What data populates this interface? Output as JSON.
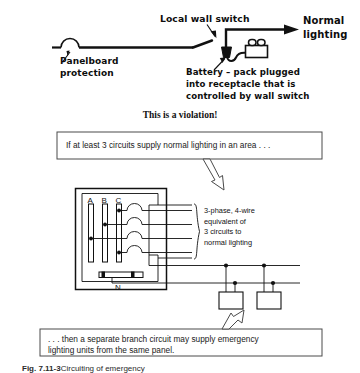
{
  "figure": {
    "type": "electrical-wiring-diagram",
    "caption_number": "Fig. 7.11-3",
    "caption_text": "Circuiting of emergency",
    "ink_color": "#111111",
    "background_color": "#ffffff"
  },
  "top_diagram": {
    "name": "violation-diagram",
    "labels": {
      "local_wall_switch": "Local wall switch",
      "normal_lighting": "Normal\nlighting",
      "panelboard_protection": "Panelboard\nprotection",
      "battery_pack": "Battery – pack plugged\ninto receptacle that is\ncontrolled by wall switch"
    },
    "verdict": "This is a violation!"
  },
  "callout_top": {
    "name": "condition-callout",
    "text": "If at least 3 circuits supply normal lighting in an area . . ."
  },
  "panel_diagram": {
    "name": "panelboard-diagram",
    "bus_labels": [
      "A",
      "B",
      "C"
    ],
    "neutral_label": "N",
    "annotation": "3-phase, 4-wire\nequivalent of\n3 circuits to\nnormal lighting",
    "breaker_count": 4,
    "emergency_unit_count": 2
  },
  "callout_bottom": {
    "name": "conclusion-callout",
    "text": ". . . then a separate branch circuit may supply emergency\nlighting units from the same panel."
  }
}
